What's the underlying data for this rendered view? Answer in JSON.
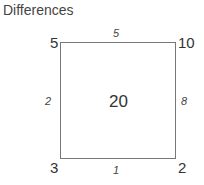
{
  "title": "Differences",
  "corners": {
    "top_left": "5",
    "top_right": "10",
    "bottom_left": "3",
    "bottom_right": "2"
  },
  "edges": {
    "top": "5",
    "right": "8",
    "bottom": "1",
    "left": "2"
  },
  "center": "20"
}
